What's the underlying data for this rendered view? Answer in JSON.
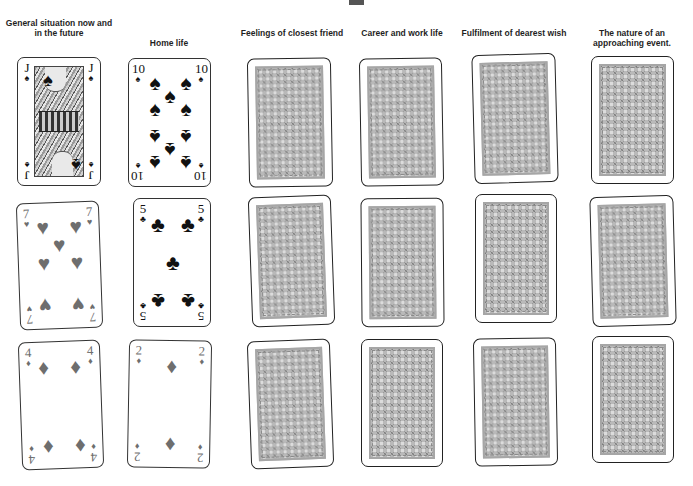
{
  "header": {
    "top_mark": ""
  },
  "columns": [
    {
      "label": "General situation now and in the future"
    },
    {
      "label": "Home life"
    },
    {
      "label": "Feelings of closest friend"
    },
    {
      "label": "Career and work life"
    },
    {
      "label": "Fulfilment of dearest wish"
    },
    {
      "label": "The nature of an approaching event."
    }
  ],
  "cards": {
    "c1r1": {
      "rank": "J",
      "suit": "♠",
      "suit_name": "spades",
      "face": "up"
    },
    "c2r1": {
      "rank": "10",
      "suit": "♠",
      "suit_name": "spades",
      "face": "up"
    },
    "c1r2": {
      "rank": "7",
      "suit": "♥",
      "suit_name": "hearts",
      "face": "up"
    },
    "c2r2": {
      "rank": "5",
      "suit": "♣",
      "suit_name": "clubs",
      "face": "up"
    },
    "c1r3": {
      "rank": "4",
      "suit": "♦",
      "suit_name": "diamonds",
      "face": "up"
    },
    "c2r3": {
      "rank": "2",
      "suit": "♦",
      "suit_name": "diamonds",
      "face": "up"
    },
    "face_down_count": 12
  },
  "colors": {
    "black_suit": "#111111",
    "red_suit_print": "#6e6e6e",
    "card_back": "#b9b9b9",
    "card_border": "#333333"
  }
}
